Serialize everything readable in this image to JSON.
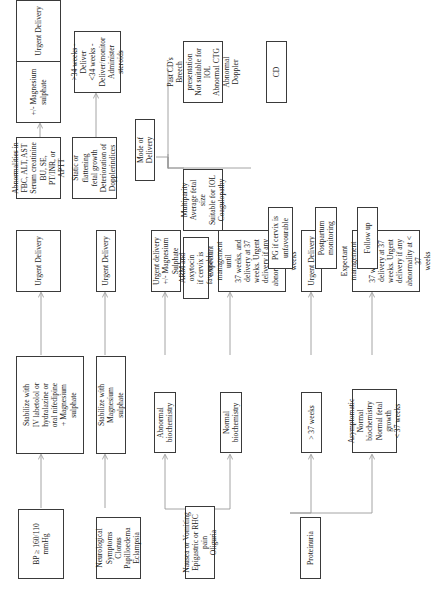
{
  "diagram": {
    "type": "flowchart",
    "orientation": "rotated-90-ccw",
    "nodes": {
      "bp": "BP ≥ 160/110\nmmHg",
      "stabilize_bp": "Stabilize with\nIV labetolol or\nhydralazine or\noral nifedipine\n+ Magnesium\nsulphate",
      "urgent1": "Urgent Delivery",
      "neuro": "Neurological\nSymptoms\nClonus\nPapilloedema\nEclampsia",
      "stabilize_mg": "Stabilize with\nMagnesium\nsulphate",
      "urgent2": "Urgent Delivery",
      "nausea": "Nausea or Vomiting\nEpigastric or RHC pain\nOliguria",
      "abn_biochem": "Abnormal\nbiochemistry",
      "urgent_mg": "Urgent delivery\n+/- Magnesium\nSulphate",
      "normal_biochem": "Normal\nbiochemistry",
      "expectant1": "Expectant\nmanagement until\n37 weeks, and\ndelivery at 37\nweeks. Urgent\ndelivery if any\nabnormality at < 37\nweeks",
      "proteinuria": "Proteinuria",
      "gt37": "> 37 weeks",
      "urgent3": "Urgent Delivery",
      "asymptomatic": "Asymptomatic\nNormal\nbiochemistry\nNormal fetal growth\n< 37 weeks",
      "expectant2": "Expectant\nmanagement until\n37 weeks, and\ndelivery at 37\nweeks. Urgent\ndelivery if any\nabnormality at < 37\nweeks",
      "abnormalities": "Abnormalities in\nFBC, ALT, AST\nSerum creatinine\nBU, SE,\nPT/INR, or APTT",
      "mg_sulphate": "+/- Magnesium\nsulphate",
      "urgent4": "Urgent Delivery",
      "static_growth": "Static or flattening\nfetal growth\nDeterioration of\nDopplerindices",
      "weeks34": ">34 weeks - Deliver\n<34 weeks -\nDeliver/monitor\nAdminister steroids",
      "mode": "Mode of Delivery",
      "multiparity": "Multiparity\nAverage fetal size\nSuitable for IOL\nCoagulopathy",
      "arm": "ARM and oxytocin\nif cervix is\nfavourable",
      "pg": "PG if cervix is\nunfavourable",
      "postpartum": "Postpartum\nmonitoring",
      "followup": "Follow up",
      "past_cd": "Past CD's\nBreech presentation\nNot suitable for IOL\nAbnormal CTG\nAbnormal Doppler",
      "cd": "CD"
    }
  }
}
